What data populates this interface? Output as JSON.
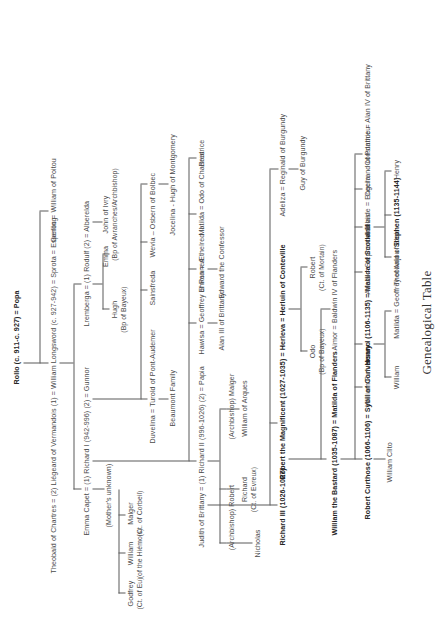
{
  "document": {
    "title": "Genealogical Table",
    "orientation": "rotated-90-ccw",
    "page_width": 436,
    "page_height": 639,
    "ink_color": "#4a4a4a",
    "rule_color": "#5a5a5a"
  },
  "generations": {
    "g1": {
      "rollo": "Rollo (c. 911-c. 927) = Popa"
    },
    "g2": {
      "theobald_chartres": "Theobald of Chartres = (2) Liégeard of Vermandois (1) = William Longsword (c. 927-942) = Sprota = Esperling",
      "gerloc": "Gerloc = William of Poitou"
    },
    "g3": {
      "emma_capet": "Emma Capet = (1) Richard I (942-996) (2) = Gunnor",
      "lremberga": "Lremberga = (1) Rodulf (2) = Alberelda",
      "godfrey": "Godfrey",
      "godfrey_sub": "(Ct. of Eu)",
      "william": "William",
      "william_sub": "(of the Hiémois)",
      "malger": "Malger",
      "malger_sub": "(Ct. of Corbeil)",
      "mothers_unknown": "(Mother's unknown)",
      "hugh": "Hugh",
      "hugh_sub": "(Bp of Bayeux)",
      "emma_ivry": "Emma",
      "john_ivry": "John of Ivry",
      "john_ivry_sub": "(Bp of Avranches/Archbishop)",
      "duvelina": "Duvelina = Turold of Pont-Audemer",
      "beaumont": "Beaumont Family",
      "sainsfreda": "Sainsfreda",
      "wevia": "Wevia – Osbern of Bolbec",
      "jocelina": "Jocelina - Hugh of Montgomery"
    },
    "g4": {
      "judith": "Judith of Brittany = (1) Richard II (996-1026) (2) = Papia",
      "robert_archbishop": "(Archbishop) Robert",
      "richard_evreux": "Richard",
      "richard_evreux_sub": "(Ct. of Evreux)",
      "nicholas": "Nicholas",
      "william_arques": "William of Arques",
      "malger_archbishop": "(Archbishop) Malger",
      "hawisa": "Hawisa = Geoffrey of Rennes",
      "alan_brittany": "Alan III of Brittany",
      "emma_aethelred": "Emma = Æthelred II",
      "edward_confessor": "Edward the Confessor",
      "matilda_odo": "Matilda = Odo of Chartres",
      "beatrice": "Beatrice"
    },
    "g5": {
      "richard_iii": "Richard III (1026-1027)",
      "robert_magnificent": "Robert the Magnificent (1027-1035) = Herleva = Herluin of Conteville",
      "odo": "Odo",
      "odo_sub": "(Bp of Bayeux)",
      "robert_mortain": "Robert",
      "robert_mortain_sub": "(Ct. of Mortain)",
      "adeliza": "Adeliza = Reginald of Burgundy",
      "guy_burgundy": "Guy of Burgundy"
    },
    "g6": {
      "william_bastard": "William the Bastard (1035-1087) = Matilda of Flanders",
      "aimor": "Aimor = Baldwin IV of Flanders"
    },
    "g7": {
      "robert_curthose": "Robert Curthose (1066-1106) = Sybil of Conversano",
      "william_rufus": "William Rufus",
      "henry_i": "Henry I (1106-1135) = Matilda of Scotland",
      "adela": "Adela = Stephen of Blois",
      "adelaide": "Adelaide = Engerrand of Ponthieu",
      "cecila": "Cecila",
      "constance": "Constance = Alan IV of Brittany"
    },
    "g8": {
      "william_clito": "William Clito",
      "william_adelin": "William",
      "matilda_anjou": "Matilda = Geoffrey of Anjou",
      "theobald_blois": "Theobald of Blois",
      "stephen": "Stephen (1135-1144)",
      "henry_blois": "Henry"
    }
  }
}
